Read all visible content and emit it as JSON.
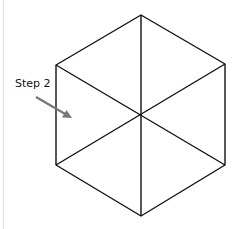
{
  "diagram": {
    "label": "Step 2",
    "shape": "hexagon-divided-into-six-triangles",
    "vertices": {
      "top": [
        141,
        15
      ],
      "upper_right": [
        225,
        64
      ],
      "lower_right": [
        225,
        165
      ],
      "bottom": [
        141,
        216
      ],
      "lower_left": [
        56,
        165
      ],
      "upper_left": [
        56,
        65
      ]
    },
    "center": [
      141,
      115
    ],
    "arrow": {
      "from": [
        36,
        97
      ],
      "to": [
        72,
        118
      ],
      "color": "#777777"
    },
    "line_color": "#111111"
  }
}
